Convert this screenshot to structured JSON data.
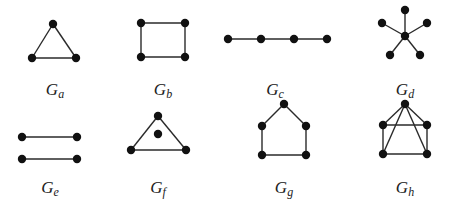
{
  "figure": {
    "graphs": [
      {
        "id": "Ga",
        "label_main": "G",
        "label_sub": "a",
        "label_pos": [
          55,
          80
        ],
        "nodes": [
          [
            53,
            24
          ],
          [
            32,
            58
          ],
          [
            76,
            58
          ]
        ],
        "edges": [
          [
            0,
            1
          ],
          [
            0,
            2
          ],
          [
            1,
            2
          ]
        ]
      },
      {
        "id": "Gb",
        "label_main": "G",
        "label_sub": "b",
        "label_pos": [
          163,
          80
        ],
        "nodes": [
          [
            141,
            23
          ],
          [
            185,
            23
          ],
          [
            141,
            57
          ],
          [
            185,
            57
          ]
        ],
        "edges": [
          [
            0,
            1
          ],
          [
            1,
            3
          ],
          [
            3,
            2
          ],
          [
            2,
            0
          ]
        ]
      },
      {
        "id": "Gc",
        "label_main": "G",
        "label_sub": "c",
        "label_pos": [
          275,
          80
        ],
        "nodes": [
          [
            228,
            39
          ],
          [
            261,
            39
          ],
          [
            294,
            39
          ],
          [
            327,
            39
          ]
        ],
        "edges": [
          [
            0,
            1
          ],
          [
            1,
            2
          ],
          [
            2,
            3
          ]
        ]
      },
      {
        "id": "Gd",
        "label_main": "G",
        "label_sub": "d",
        "label_pos": [
          405,
          80
        ],
        "nodes": [
          [
            405,
            36
          ],
          [
            405,
            10
          ],
          [
            382,
            23
          ],
          [
            427,
            23
          ],
          [
            390,
            55
          ],
          [
            420,
            55
          ]
        ],
        "edges": [
          [
            0,
            1
          ],
          [
            0,
            2
          ],
          [
            0,
            3
          ],
          [
            0,
            4
          ],
          [
            0,
            5
          ]
        ]
      },
      {
        "id": "Ge",
        "label_main": "G",
        "label_sub": "e",
        "label_pos": [
          50,
          178
        ],
        "nodes": [
          [
            22,
            137
          ],
          [
            77,
            137
          ],
          [
            22,
            159
          ],
          [
            77,
            159
          ]
        ],
        "edges": [
          [
            0,
            1
          ],
          [
            2,
            3
          ]
        ]
      },
      {
        "id": "Gf",
        "label_main": "G",
        "label_sub": "f",
        "label_pos": [
          158,
          178
        ],
        "nodes": [
          [
            158,
            116
          ],
          [
            158,
            134
          ],
          [
            131,
            150
          ],
          [
            186,
            150
          ]
        ],
        "edges": [
          [
            0,
            2
          ],
          [
            0,
            3
          ],
          [
            2,
            3
          ]
        ]
      },
      {
        "id": "Gg",
        "label_main": "G",
        "label_sub": "g",
        "label_pos": [
          284,
          178
        ],
        "nodes": [
          [
            284,
            104
          ],
          [
            262,
            126
          ],
          [
            306,
            126
          ],
          [
            262,
            155
          ],
          [
            306,
            155
          ]
        ],
        "edges": [
          [
            0,
            1
          ],
          [
            0,
            2
          ],
          [
            1,
            3
          ],
          [
            2,
            4
          ],
          [
            3,
            4
          ]
        ]
      },
      {
        "id": "Gh",
        "label_main": "G",
        "label_sub": "h",
        "label_pos": [
          405,
          178
        ],
        "nodes": [
          [
            405,
            104
          ],
          [
            383,
            125
          ],
          [
            427,
            125
          ],
          [
            383,
            154
          ],
          [
            427,
            154
          ]
        ],
        "edges": [
          [
            0,
            1
          ],
          [
            0,
            2
          ],
          [
            0,
            3
          ],
          [
            0,
            4
          ],
          [
            1,
            2
          ],
          [
            1,
            3
          ],
          [
            2,
            4
          ],
          [
            3,
            4
          ]
        ]
      }
    ],
    "colors": {
      "edge": "#2a2a2a",
      "node": "#111111",
      "background": "#ffffff"
    }
  }
}
